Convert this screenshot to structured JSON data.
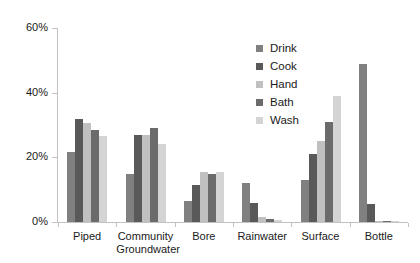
{
  "chart_data": {
    "type": "bar",
    "title": "",
    "subtitle": "",
    "xlabel": "",
    "ylabel": "",
    "ylim": [
      0,
      60
    ],
    "yticks": [
      0,
      20,
      40,
      60
    ],
    "ytick_labels": [
      "0%",
      "20%",
      "40%",
      "60%"
    ],
    "grid": false,
    "legend_position": "top-right-inside",
    "orientation": "vertical",
    "grouping": "clustered",
    "units": "percent",
    "categories": [
      "Piped",
      "Community Groundwater",
      "Bore",
      "Rainwater",
      "Surface",
      "Bottle"
    ],
    "category_label_lines": [
      [
        "Piped"
      ],
      [
        "Community",
        "Groundwater"
      ],
      [
        "Bore"
      ],
      [
        "Rainwater"
      ],
      [
        "Surface"
      ],
      [
        "Bottle"
      ]
    ],
    "series": [
      {
        "name": "Drink",
        "color": "#808080",
        "values": [
          21.5,
          15.0,
          6.5,
          12.0,
          13.0,
          49.0
        ]
      },
      {
        "name": "Cook",
        "color": "#595959",
        "values": [
          32.0,
          27.0,
          11.5,
          6.0,
          21.0,
          5.5
        ]
      },
      {
        "name": "Hand",
        "color": "#c0c0c0",
        "values": [
          30.5,
          27.0,
          15.5,
          1.5,
          25.0,
          0.4
        ]
      },
      {
        "name": "Bath",
        "color": "#6b6b6b",
        "values": [
          28.5,
          29.0,
          15.0,
          1.0,
          31.0,
          0.3
        ]
      },
      {
        "name": "Wash",
        "color": "#d4d4d4",
        "values": [
          26.5,
          24.0,
          15.5,
          0.5,
          39.0,
          0.2
        ]
      }
    ]
  },
  "legend": {
    "items": [
      {
        "label": "Drink",
        "color": "#808080"
      },
      {
        "label": "Cook",
        "color": "#595959"
      },
      {
        "label": "Hand",
        "color": "#c0c0c0"
      },
      {
        "label": "Bath",
        "color": "#6b6b6b"
      },
      {
        "label": "Wash",
        "color": "#d4d4d4"
      }
    ]
  },
  "axis": {
    "color": "#c2c2c2"
  }
}
